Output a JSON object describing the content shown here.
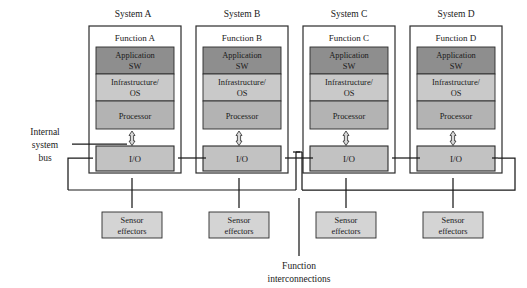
{
  "diagram": {
    "systems": [
      {
        "id": "A",
        "system_label": "System A",
        "function_label": "Function A",
        "layers": [
          {
            "name": "application-sw",
            "label_line1": "Application",
            "label_line2": "SW",
            "color": "#8e8e8e"
          },
          {
            "name": "infrastructure-os",
            "label_line1": "Infrastructure/",
            "label_line2": "OS",
            "color": "#c9c9c9"
          },
          {
            "name": "processor",
            "label_line1": "Processor",
            "label_line2": "",
            "color": "#b3b3b3"
          }
        ],
        "io_label": "I/O",
        "sensor_label_line1": "Sensor",
        "sensor_label_line2": "effectors"
      },
      {
        "id": "B",
        "system_label": "System B",
        "function_label": "Function B",
        "layers": [
          {
            "name": "application-sw",
            "label_line1": "Application",
            "label_line2": "SW",
            "color": "#8e8e8e"
          },
          {
            "name": "infrastructure-os",
            "label_line1": "Infrastructure/",
            "label_line2": "OS",
            "color": "#c9c9c9"
          },
          {
            "name": "processor",
            "label_line1": "Processor",
            "label_line2": "",
            "color": "#b3b3b3"
          }
        ],
        "io_label": "I/O",
        "sensor_label_line1": "Sensor",
        "sensor_label_line2": "effectors"
      },
      {
        "id": "C",
        "system_label": "System C",
        "function_label": "Function C",
        "layers": [
          {
            "name": "application-sw",
            "label_line1": "Application",
            "label_line2": "SW",
            "color": "#8e8e8e"
          },
          {
            "name": "infrastructure-os",
            "label_line1": "Infrastructure/",
            "label_line2": "OS",
            "color": "#c9c9c9"
          },
          {
            "name": "processor",
            "label_line1": "Processor",
            "label_line2": "",
            "color": "#b3b3b3"
          }
        ],
        "io_label": "I/O",
        "sensor_label_line1": "Sensor",
        "sensor_label_line2": "effectors"
      },
      {
        "id": "D",
        "system_label": "System D",
        "function_label": "Function D",
        "layers": [
          {
            "name": "application-sw",
            "label_line1": "Application",
            "label_line2": "SW",
            "color": "#8e8e8e"
          },
          {
            "name": "infrastructure-os",
            "label_line1": "Infrastructure/",
            "label_line2": "OS",
            "color": "#c9c9c9"
          },
          {
            "name": "processor",
            "label_line1": "Processor",
            "label_line2": "",
            "color": "#b3b3b3"
          }
        ],
        "io_label": "I/O",
        "sensor_label_line1": "Sensor",
        "sensor_label_line2": "effectors"
      }
    ],
    "annotations": {
      "internal_bus_line1": "Internal",
      "internal_bus_line2": "system",
      "internal_bus_line3": "bus",
      "function_interconnect_line1": "Function",
      "function_interconnect_line2": "interconnections"
    },
    "colors": {
      "background": "#ffffff",
      "stroke": "#1a1a1a",
      "application_sw": "#8e8e8e",
      "infrastructure_os": "#c9c9c9",
      "processor": "#b3b3b3",
      "io": "#c2c2c2",
      "sensor_effectors": "#d4d4d4"
    }
  }
}
